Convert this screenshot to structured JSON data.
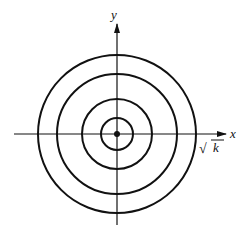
{
  "diagram": {
    "center": {
      "x": 117,
      "y": 134
    },
    "circle_radii": [
      16,
      35,
      60,
      79
    ],
    "axes": {
      "x_label": "x",
      "y_label": "y"
    },
    "annotation": {
      "radical": "√",
      "radicand": "k"
    },
    "colors": {
      "stroke": "#111111",
      "background": "#ffffff"
    }
  }
}
